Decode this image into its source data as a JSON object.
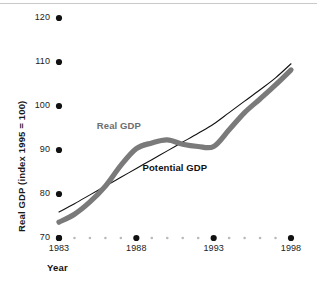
{
  "chart_data": {
    "type": "line",
    "title": "",
    "xlabel": "Year",
    "ylabel": "Real GDP (index 1995 = 100)",
    "xlim": [
      1983,
      1998
    ],
    "ylim": [
      70,
      120
    ],
    "grid": false,
    "legend_position": "inline-annotations",
    "x_ticks_major": [
      "1983",
      "1988",
      "1993",
      "1998"
    ],
    "x_tick_values_major": [
      1983,
      1988,
      1993,
      1998
    ],
    "x_ticks_minor": [
      1984,
      1985,
      1986,
      1987,
      1989,
      1990,
      1991,
      1992,
      1994,
      1995,
      1996,
      1997
    ],
    "y_ticks": [
      "70",
      "80",
      "90",
      "100",
      "110",
      "120"
    ],
    "y_tick_values": [
      70,
      80,
      90,
      100,
      110,
      120
    ],
    "x": [
      1983,
      1984,
      1985,
      1986,
      1987,
      1988,
      1989,
      1990,
      1991,
      1992,
      1993,
      1994,
      1995,
      1996,
      1997,
      1998
    ],
    "series": [
      {
        "name": "Real GDP",
        "color": "#7a7a7a",
        "style": "thick-band",
        "values": [
          73.6,
          75.4,
          78.2,
          81.8,
          86.5,
          90.3,
          91.6,
          92.3,
          91.3,
          90.8,
          90.8,
          94.6,
          98.5,
          101.6,
          104.8,
          108.2
        ]
      },
      {
        "name": "Potential GDP",
        "color": "#111111",
        "style": "thin-line",
        "values": [
          75.9,
          77.8,
          79.8,
          81.8,
          83.8,
          85.8,
          87.8,
          89.8,
          91.8,
          93.8,
          95.9,
          98.5,
          101.1,
          103.7,
          106.4,
          109.6
        ]
      }
    ],
    "annotations": [
      {
        "text": "Real GDP",
        "x": 1987.0,
        "y": 95.5,
        "color": "#6e6e6e"
      },
      {
        "text": "Potential GDP",
        "x": 1990.6,
        "y": 86.0,
        "color": "#111111"
      }
    ]
  },
  "axes": {
    "y_title": "Real GDP (index 1995 = 100)",
    "x_title": "Year",
    "y_tick_labels": [
      "120",
      "110",
      "100",
      "90",
      "80",
      "70"
    ],
    "x_tick_labels": [
      "1983",
      "1988",
      "1993",
      "1998"
    ]
  },
  "labels": {
    "real_gdp": "Real GDP",
    "potential_gdp": "Potential GDP"
  },
  "colors": {
    "real_gdp": "#7a7a7a",
    "potential_gdp": "#111111",
    "tick_dot": "#111111",
    "minor_dot": "#b9b9b9",
    "background": "#ffffff",
    "top_rule": "#c9c9c9"
  }
}
